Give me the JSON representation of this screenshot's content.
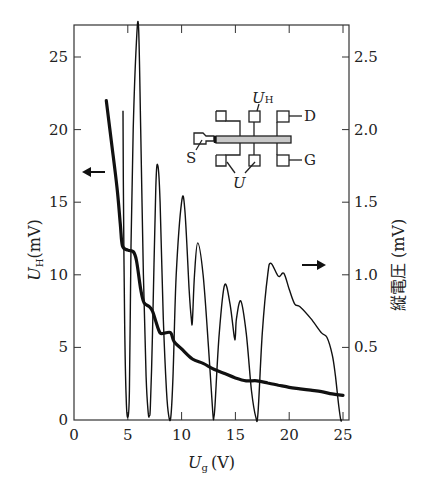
{
  "chart_data": {
    "type": "line",
    "title": "",
    "xlabel": "U_g (V)",
    "xlabel_main": "U",
    "xlabel_sub": "g",
    "xlabel_unit": "(V)",
    "ylabel_left": "U_H (mV)",
    "ylabel_left_main": "U",
    "ylabel_left_sub": "H",
    "ylabel_left_unit": "(mV)",
    "ylabel_right": "縦電圧 (mV)",
    "xlim": [
      0,
      25.5
    ],
    "ylim_left": [
      0,
      27
    ],
    "ylim_right": [
      0,
      2.7
    ],
    "x_ticks": [
      0,
      5,
      10,
      15,
      20,
      25
    ],
    "x_tick_labels": [
      "0",
      "5",
      "10",
      "15",
      "20",
      "25"
    ],
    "y_left_ticks": [
      0,
      5,
      10,
      15,
      20,
      25
    ],
    "y_left_tick_labels": [
      "0",
      "5",
      "10",
      "15",
      "20",
      "25"
    ],
    "y_right_ticks": [
      0.5,
      1.0,
      1.5,
      2.0,
      2.5
    ],
    "y_right_tick_labels": [
      "0.5",
      "1.0",
      "1.5",
      "2.0",
      "2.5"
    ],
    "grid": false,
    "series": [
      {
        "name": "Hall voltage U_H",
        "axis": "left",
        "style": "thick",
        "x": [
          3.0,
          3.5,
          4.0,
          4.3,
          4.5,
          5.0,
          5.5,
          5.8,
          6.2,
          6.5,
          7.0,
          7.3,
          7.6,
          8.0,
          8.5,
          9.0,
          9.3,
          10.0,
          11.0,
          12.0,
          13.0,
          14.0,
          15.0,
          16.0,
          17.0,
          18.0,
          19.0,
          20.0,
          21.0,
          22.0,
          23.0,
          24.0,
          25.0
        ],
        "y": [
          22.0,
          19.0,
          16.0,
          13.5,
          12.0,
          11.7,
          11.6,
          11.0,
          9.0,
          8.1,
          7.8,
          7.5,
          6.8,
          6.0,
          6.0,
          6.0,
          5.4,
          4.9,
          4.2,
          3.9,
          3.5,
          3.2,
          2.9,
          2.7,
          2.7,
          2.55,
          2.4,
          2.25,
          2.15,
          2.05,
          1.95,
          1.8,
          1.7
        ]
      },
      {
        "name": "Longitudinal voltage (縦電圧)",
        "axis": "right",
        "style": "thin",
        "x": [
          4.55,
          4.6,
          4.7,
          4.85,
          5.0,
          5.15,
          5.3,
          5.5,
          5.8,
          6.0,
          6.2,
          6.45,
          6.7,
          6.9,
          7.0,
          7.1,
          7.3,
          7.6,
          7.8,
          8.0,
          8.3,
          8.6,
          8.8,
          9.0,
          9.2,
          9.5,
          10.0,
          10.3,
          10.7,
          10.9,
          11.0,
          11.2,
          11.5,
          12.0,
          12.5,
          12.9,
          13.0,
          13.1,
          13.5,
          14.0,
          14.5,
          14.9,
          15.0,
          15.1,
          15.5,
          16.0,
          16.5,
          16.9,
          17.1,
          17.5,
          18.0,
          18.3,
          19.0,
          19.5,
          20.0,
          20.5,
          21.0,
          22.0,
          23.0,
          23.5,
          24.0,
          24.3,
          24.6,
          24.8,
          24.9
        ],
        "y": [
          2.13,
          1.5,
          0.7,
          0.15,
          0.02,
          0.2,
          1.2,
          2.0,
          2.6,
          2.7,
          2.0,
          1.0,
          0.3,
          0.05,
          0.03,
          0.1,
          0.6,
          1.6,
          1.75,
          1.5,
          0.7,
          0.2,
          0.03,
          0.02,
          0.3,
          1.0,
          1.5,
          1.45,
          0.9,
          0.7,
          0.68,
          1.0,
          1.22,
          1.0,
          0.5,
          0.05,
          0.02,
          0.1,
          0.6,
          0.93,
          0.8,
          0.57,
          0.58,
          0.7,
          0.82,
          0.6,
          0.2,
          0.02,
          0.05,
          0.6,
          1.0,
          1.08,
          0.99,
          1.01,
          0.9,
          0.8,
          0.78,
          0.7,
          0.6,
          0.57,
          0.45,
          0.3,
          0.1,
          0.0,
          0.0
        ]
      }
    ],
    "annotations": [
      {
        "type": "arrow",
        "direction": "left",
        "meaning": "thick curve uses left axis",
        "at_y_left": 17
      },
      {
        "type": "arrow",
        "direction": "right",
        "meaning": "thin curve uses right axis",
        "at_y_right": 1.05
      }
    ]
  },
  "inset": {
    "description": "Hall bar device schematic",
    "labels": {
      "hall": "U",
      "hall_sub": "H",
      "drain": "D",
      "source": "S",
      "gate": "G",
      "longitudinal": "U"
    }
  },
  "colors": {
    "line": "#111111",
    "axis": "#333333",
    "bar_fill": "#c8c8c8"
  }
}
